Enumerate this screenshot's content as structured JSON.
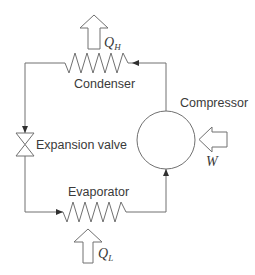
{
  "diagram": {
    "type": "refrigeration-cycle",
    "components": {
      "condenser": {
        "label": "Condenser"
      },
      "compressor": {
        "label": "Compressor"
      },
      "expansion_valve": {
        "label": "Expansion valve"
      },
      "evaporator": {
        "label": "Evaporator"
      }
    },
    "flows": {
      "heat_out": {
        "symbol": "Q",
        "subscript": "H"
      },
      "heat_in": {
        "symbol": "Q",
        "subscript": "L"
      },
      "work_in": {
        "symbol": "W"
      }
    },
    "colors": {
      "line": "#707070",
      "text": "#3a3a3a",
      "background": "#ffffff"
    }
  }
}
